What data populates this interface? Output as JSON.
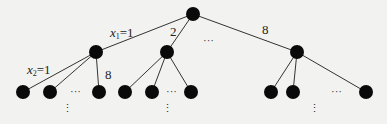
{
  "diagram": {
    "type": "search-tree",
    "nodes": {
      "root": {
        "x": 193,
        "y": 14
      },
      "level1": [
        {
          "id": "a",
          "x": 96,
          "y": 52
        },
        {
          "id": "b",
          "x": 167,
          "y": 52
        },
        {
          "id": "c",
          "x": 297,
          "y": 52
        }
      ],
      "leaves": [
        {
          "parent": "a",
          "x": 23,
          "y": 92
        },
        {
          "parent": "a",
          "x": 50,
          "y": 92
        },
        {
          "parent": "a",
          "x": 99,
          "y": 92
        },
        {
          "parent": "b",
          "x": 125,
          "y": 92
        },
        {
          "parent": "b",
          "x": 152,
          "y": 92
        },
        {
          "parent": "b",
          "x": 191,
          "y": 92
        },
        {
          "parent": "c",
          "x": 271,
          "y": 92
        },
        {
          "parent": "c",
          "x": 293,
          "y": 92
        },
        {
          "parent": "c",
          "x": 366,
          "y": 92
        }
      ]
    },
    "edge_labels": {
      "root_a_var": "x",
      "root_a_sub": "1",
      "root_a_val": "=1",
      "root_b": "2",
      "root_c": "8",
      "a_first_var": "x",
      "a_first_sub": "2",
      "a_first_val": "=1",
      "a_last": "8"
    },
    "ellipsis_horizontal": "···",
    "ellipsis_vertical": "⋮"
  }
}
